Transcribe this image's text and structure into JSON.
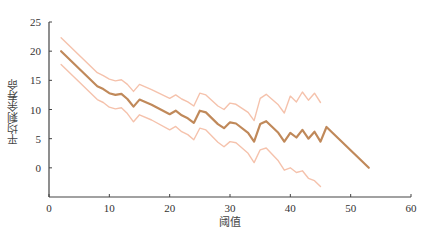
{
  "chart_data": {
    "type": "line",
    "title": "",
    "xlabel": "阈值",
    "ylabel": "平均剩余寿命",
    "xlim": [
      0,
      60
    ],
    "ylim": [
      -5,
      25
    ],
    "xticks": [
      0,
      10,
      20,
      30,
      40,
      50,
      60
    ],
    "yticks": [
      0,
      5,
      10,
      15,
      20,
      25
    ],
    "grid": false,
    "legend": null,
    "series": [
      {
        "name": "upper",
        "color": "#f5c2ac",
        "x": [
          2,
          8,
          9,
          10,
          11,
          12,
          13,
          14,
          15,
          17,
          20,
          21,
          22,
          23,
          24,
          25,
          26,
          28,
          29,
          30,
          31,
          33,
          34,
          35,
          36,
          38,
          39,
          40,
          41,
          42,
          43,
          44,
          45
        ],
        "values": [
          22.3,
          16.3,
          15.8,
          15.2,
          14.9,
          15.1,
          14.3,
          13.1,
          14.3,
          13.4,
          11.9,
          12.5,
          11.8,
          11.3,
          10.6,
          12.8,
          12.5,
          10.6,
          10.0,
          11.1,
          10.9,
          9.5,
          8.1,
          11.9,
          12.6,
          10.8,
          9.4,
          12.3,
          11.3,
          13.0,
          11.6,
          12.8,
          11.2
        ]
      },
      {
        "name": "mean",
        "color": "#c0895a",
        "x": [
          2,
          8,
          9,
          10,
          11,
          12,
          13,
          14,
          15,
          17,
          20,
          21,
          22,
          23,
          24,
          25,
          26,
          28,
          29,
          30,
          31,
          33,
          34,
          35,
          36,
          38,
          39,
          40,
          41,
          42,
          43,
          44,
          45,
          46,
          53
        ],
        "values": [
          20.0,
          14.0,
          13.5,
          12.8,
          12.5,
          12.7,
          11.8,
          10.5,
          11.7,
          10.8,
          9.2,
          9.8,
          9.0,
          8.5,
          7.7,
          9.8,
          9.5,
          7.5,
          6.8,
          7.8,
          7.6,
          6.0,
          4.5,
          7.5,
          8.0,
          6.0,
          4.5,
          6.0,
          5.2,
          6.5,
          5.0,
          6.2,
          4.5,
          7.0,
          0.0
        ]
      },
      {
        "name": "lower",
        "color": "#f5c2ac",
        "x": [
          2,
          8,
          9,
          10,
          11,
          12,
          13,
          14,
          15,
          17,
          20,
          21,
          22,
          23,
          24,
          25,
          26,
          28,
          29,
          30,
          31,
          33,
          34,
          35,
          36,
          38,
          39,
          40,
          41,
          42,
          43,
          44,
          45
        ],
        "values": [
          17.7,
          11.7,
          11.2,
          10.4,
          10.1,
          10.3,
          9.3,
          7.9,
          9.1,
          8.2,
          6.5,
          7.1,
          6.2,
          5.7,
          4.8,
          6.8,
          6.5,
          4.4,
          3.6,
          4.5,
          4.3,
          2.5,
          0.9,
          3.1,
          3.4,
          1.2,
          -0.4,
          0.0,
          -0.8,
          -0.5,
          -1.8,
          -2.2,
          -3.2
        ]
      }
    ]
  },
  "axes": {
    "x_label": "阈值",
    "y_label": "平均剩余寿命"
  }
}
